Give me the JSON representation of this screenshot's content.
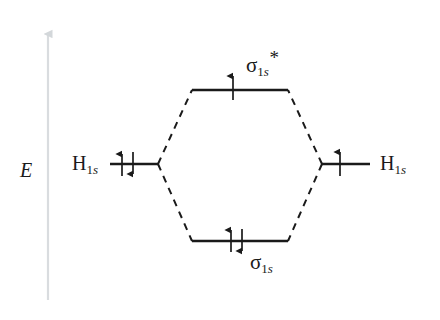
{
  "diagram": {
    "type": "molecular-orbital-energy-diagram",
    "title": "",
    "background_color": "#ffffff",
    "line_color": "#1a1a1a",
    "axis_color": "#d9dcdf",
    "axis": {
      "label": "E",
      "meaning": "energy-increasing-upward",
      "direction": "up",
      "x": 48,
      "y_top": 30,
      "y_bottom": 300,
      "label_x": 22,
      "label_y": 170
    },
    "atomic_orbitals": [
      {
        "side": "left",
        "label_symbol": "H",
        "label_sub_number": "1",
        "label_sub_letter": "s",
        "label_text": "H1s",
        "level_y": 164,
        "x_start": 110,
        "x_end": 158,
        "label_x": 75,
        "label_y": 163,
        "electrons": 2,
        "spins": [
          "up",
          "down"
        ]
      },
      {
        "side": "right",
        "label_symbol": "H",
        "label_sub_number": "1",
        "label_sub_letter": "s",
        "label_text": "H1s",
        "level_y": 164,
        "x_start": 322,
        "x_end": 370,
        "label_x": 381,
        "label_y": 163,
        "electrons": 1,
        "spins": [
          "up"
        ]
      }
    ],
    "molecular_orbitals": [
      {
        "name": "antibonding",
        "label_symbol": "σ",
        "label_sub_number": "1",
        "label_sub_letter": "s",
        "label_star": "*",
        "label_text": "σ1s*",
        "level_y": 90,
        "x_start": 192,
        "x_end": 288,
        "label_x": 248,
        "label_y": 58,
        "electrons": 1,
        "spins": [
          "up"
        ]
      },
      {
        "name": "bonding",
        "label_symbol": "σ",
        "label_sub_number": "1",
        "label_sub_letter": "s",
        "label_star": "",
        "label_text": "σ1s",
        "level_y": 241,
        "x_start": 192,
        "x_end": 288,
        "label_x": 252,
        "label_y": 258,
        "electrons": 2,
        "spins": [
          "up",
          "down"
        ]
      }
    ],
    "correlation_lines": [
      {
        "name": "left-to-antibonding",
        "x1": 158,
        "y1": 164,
        "x2": 192,
        "y2": 90
      },
      {
        "name": "left-to-bonding",
        "x1": 158,
        "y1": 164,
        "x2": 192,
        "y2": 241
      },
      {
        "name": "right-to-antibonding",
        "x1": 322,
        "y1": 164,
        "x2": 288,
        "y2": 90
      },
      {
        "name": "right-to-bonding",
        "x1": 322,
        "y1": 164,
        "x2": 288,
        "y2": 241
      },
      {
        "style": "dashed",
        "dash_pattern": "7 6",
        "width": 2
      }
    ],
    "electron_totals": {
      "total": 3,
      "bonding": 2,
      "antibonding": 1
    }
  }
}
